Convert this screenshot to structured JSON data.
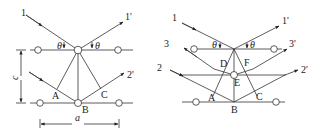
{
  "figures": [
    {
      "id": "left",
      "title": "Bragg reflection from two atomic planes",
      "labels": {
        "ray_in_1": "1",
        "ray_out_1": "1'",
        "ray_out_2": "2'",
        "theta_left": "θ",
        "theta_right": "θ",
        "point_A": "A",
        "point_B": "B",
        "point_C": "C",
        "spacing_c": "c",
        "spacing_a": "a"
      }
    },
    {
      "id": "right",
      "title": "Bragg reflection with intermediate plane",
      "labels": {
        "ray_in_1": "1",
        "ray_out_1": "1'",
        "ray_in_2": "2",
        "ray_out_2": "2'",
        "ray_in_3": "3",
        "ray_out_3": "3'",
        "theta_left": "θ",
        "theta_right": "θ",
        "point_A": "A",
        "point_B": "B",
        "point_C": "C",
        "point_D": "D",
        "point_E": "E",
        "point_F": "F"
      }
    }
  ],
  "colors": {
    "line": "#333333",
    "atom_fill": "#ffffff"
  }
}
